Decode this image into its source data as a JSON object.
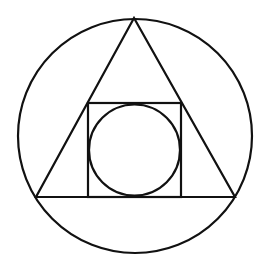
{
  "diagram": {
    "background": "#ffffff",
    "stroke_color": "#111111",
    "stroke_width": 2.2,
    "outer_circle": {
      "cx": 135,
      "cy": 136,
      "r": 117
    },
    "triangle": {
      "points": "134,18 36,197 235,197"
    },
    "square": {
      "x": 88,
      "y": 103,
      "width": 93,
      "height": 94
    },
    "inner_circle": {
      "cx": 134.5,
      "cy": 150,
      "r": 45.5
    }
  }
}
